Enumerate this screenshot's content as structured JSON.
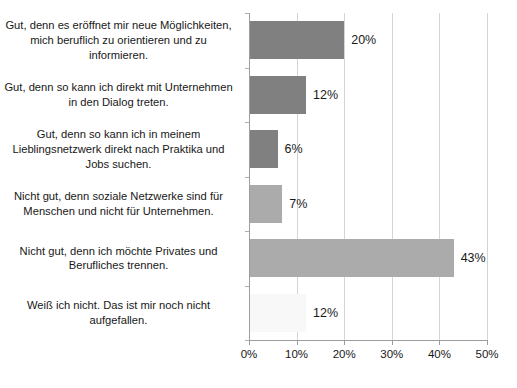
{
  "chart_data": {
    "type": "bar",
    "orientation": "horizontal",
    "title": "",
    "subtitle": "",
    "xlabel": "",
    "ylabel": "",
    "xlim": [
      0,
      50
    ],
    "xtick_labels": [
      "0%",
      "10%",
      "20%",
      "30%",
      "40%",
      "50%"
    ],
    "xticks": [
      0,
      10,
      20,
      30,
      40,
      50
    ],
    "grid": true,
    "legend": false,
    "categories": [
      "Gut, denn es eröffnet mir neue Möglichkeiten, mich beruflich zu orientieren und zu informieren.",
      "Gut, denn so kann ich direkt mit Unternehmen in den Dialog treten.",
      "Gut, denn so kann ich in meinem Lieblingsnetzwerk direkt nach Praktika und Jobs suchen.",
      "Nicht gut, denn soziale Netzwerke sind für Menschen und nicht für Unternehmen.",
      "Nicht gut, denn ich möchte Privates und Berufliches trennen.",
      "Weiß ich nicht. Das ist mir noch nicht aufgefallen."
    ],
    "values": [
      20,
      12,
      6,
      7,
      43,
      12
    ],
    "data_labels": [
      "20%",
      "12%",
      "6%",
      "7%",
      "43%",
      "12%"
    ],
    "bar_colors": [
      "#808080",
      "#808080",
      "#808080",
      "#ABABAB",
      "#ABABAB",
      "#F8F8F8"
    ]
  },
  "axis": {
    "grid_color": "#D4D4D4",
    "axis_color": "#9E9E9E"
  }
}
